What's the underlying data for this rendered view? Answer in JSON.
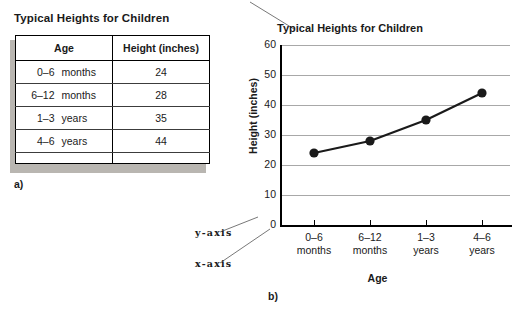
{
  "panel_a": {
    "figure_label": "a)",
    "table": {
      "title": "Typical Heights for Children",
      "columns": [
        "Age",
        "Height (inches)"
      ],
      "rows": [
        {
          "age_value": "0–6",
          "age_unit": "months",
          "height": "24"
        },
        {
          "age_value": "6–12",
          "age_unit": "months",
          "height": "28"
        },
        {
          "age_value": "1–3",
          "age_unit": "years",
          "height": "35"
        },
        {
          "age_value": "4–6",
          "age_unit": "years",
          "height": "44"
        }
      ]
    }
  },
  "panel_b": {
    "figure_label": "b)",
    "callout_y": "y-axis",
    "callout_x": "x-axis",
    "chart_data": {
      "type": "line",
      "title": "Typical Heights for Children",
      "xlabel": "Age",
      "ylabel": "Height (inches)",
      "categories": [
        "0–6\nmonths",
        "6–12\nmonths",
        "1–3\nyears",
        "4–6\nyears"
      ],
      "category_lines": [
        [
          "0–6",
          "months"
        ],
        [
          "6–12",
          "months"
        ],
        [
          "1–3",
          "years"
        ],
        [
          "4–6",
          "years"
        ]
      ],
      "values": [
        24,
        28,
        35,
        44
      ],
      "ylim": [
        0,
        60
      ],
      "ytick_labels": [
        "60",
        "50",
        "40",
        "30",
        "20",
        "10",
        "0"
      ],
      "ytick_values": [
        60,
        50,
        40,
        30,
        20,
        10,
        0
      ],
      "grid": true,
      "grid_color": "#a8a8a8",
      "legend": "none",
      "marker": "filled-circle",
      "line_color": "#1a1a1a",
      "marker_color": "#1a1a1a"
    }
  }
}
